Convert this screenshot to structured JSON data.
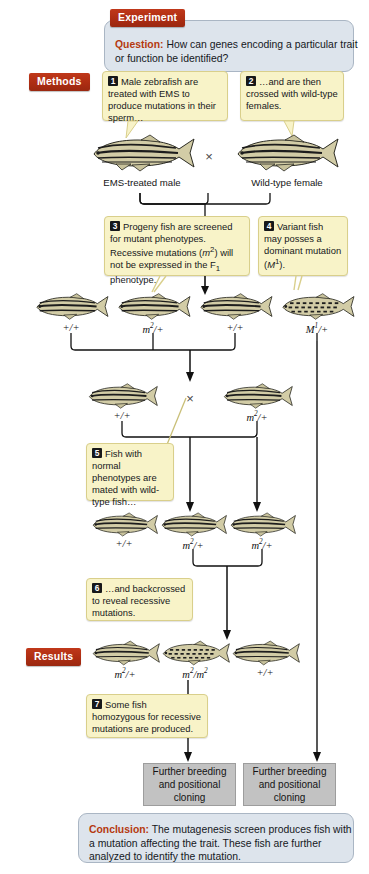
{
  "figure": {
    "experiment_label": "Experiment",
    "methods_label": "Methods",
    "results_label": "Results",
    "question_kw": "Question:",
    "question_text": " How can genes encoding a particular trait or function be identified?",
    "conclusion_kw": "Conclusion:",
    "conclusion_text": " The mutagenesis screen produces fish with a mutation affecting the trait. These fish are further analyzed to identify the mutation."
  },
  "steps": [
    {
      "num": "1",
      "text": "Male zebrafish are treated with EMS to produce mutations in their sperm…"
    },
    {
      "num": "2",
      "text": "…and are then crossed with wild-type females."
    },
    {
      "num": "3",
      "text": "Progeny fish are screened for mutant phenotypes. Recessive mutations (m2) will not be expressed in the F1 phenotype."
    },
    {
      "num": "4",
      "text": "Variant fish may posses a dominant mutation (M1)."
    },
    {
      "num": "5",
      "text": "Fish with normal phenotypes are mated with wild-type fish…"
    },
    {
      "num": "6",
      "text": "…and backcrossed to reveal recessive mutations."
    },
    {
      "num": "7",
      "text": "Some fish homozygous for recessive mutations are produced."
    }
  ],
  "parents": {
    "male_label": "EMS-treated male",
    "female_label": "Wild-type female",
    "cross_symbol": "×"
  },
  "f1_row": {
    "genotypes": [
      "+/+",
      "m2/+",
      "+/+",
      "M1/+"
    ]
  },
  "cross2": {
    "left_genotype": "+/+",
    "right_genotype": "m2/+",
    "cross_symbol": "×"
  },
  "f2_row": {
    "genotypes": [
      "+/+",
      "m2/+",
      "m2/+"
    ]
  },
  "results_row": {
    "genotypes": [
      "m2/+",
      "m2/m2",
      "+/+"
    ]
  },
  "outcome_boxes": [
    "Further breeding and positional cloning",
    "Further breeding and positional cloning"
  ],
  "colors": {
    "accent_red": "#ad2d12",
    "panel_blue": "#dde4ec",
    "callout_yellow": "#f8f3c8",
    "grey_box": "#c2c2c2",
    "fish_body": "#cfc9a4",
    "fish_stripe": "#1d1d1d"
  }
}
